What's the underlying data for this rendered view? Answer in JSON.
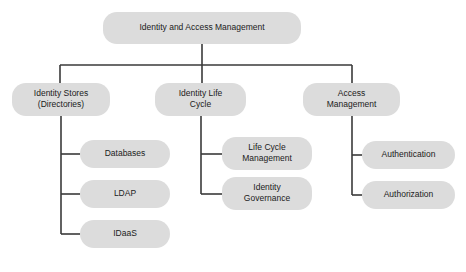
{
  "diagram": {
    "title": "Identity and Access Management",
    "type": "hierarchy-tree",
    "colors": {
      "node_fill": "#dcdcdc",
      "node_text": "#1b1b1b",
      "connector": "#3a3a3a",
      "background": "#ffffff"
    },
    "style": {
      "node_corner_radius": 14,
      "connector_width": 1.6,
      "font_size_root": 8.5,
      "font_size_level2": 8.5,
      "font_size_leaf": 8.5
    },
    "nodes": [
      {
        "id": "root",
        "label": "Identity and Access Management",
        "lines": [
          "Identity and Access Management"
        ],
        "level": 0,
        "x": 103,
        "y": 12,
        "w": 198,
        "h": 32
      },
      {
        "id": "identity-stores",
        "label": "Identity Stores (Directories)",
        "lines": [
          "Identity Stores",
          "(Directories)"
        ],
        "level": 1,
        "x": 12,
        "y": 83,
        "w": 98,
        "h": 33
      },
      {
        "id": "identity-life-cycle",
        "label": "Identity Life Cycle",
        "lines": [
          "Identity Life",
          "Cycle"
        ],
        "level": 1,
        "x": 155,
        "y": 83,
        "w": 91,
        "h": 33
      },
      {
        "id": "access-management",
        "label": "Access Management",
        "lines": [
          "Access",
          "Management"
        ],
        "level": 1,
        "x": 303,
        "y": 83,
        "w": 97,
        "h": 33
      },
      {
        "id": "databases",
        "label": "Databases",
        "lines": [
          "Databases"
        ],
        "level": 2,
        "x": 80,
        "y": 140,
        "w": 90,
        "h": 28
      },
      {
        "id": "ldap",
        "label": "LDAP",
        "lines": [
          "LDAP"
        ],
        "level": 2,
        "x": 80,
        "y": 180,
        "w": 90,
        "h": 28
      },
      {
        "id": "idaas",
        "label": "IDaaS",
        "lines": [
          "IDaaS"
        ],
        "level": 2,
        "x": 80,
        "y": 220,
        "w": 90,
        "h": 28
      },
      {
        "id": "life-cycle-management",
        "label": "Life Cycle Management",
        "lines": [
          "Life Cycle",
          "Management"
        ],
        "level": 2,
        "x": 222,
        "y": 137,
        "w": 90,
        "h": 33
      },
      {
        "id": "identity-governance",
        "label": "Identity Governance",
        "lines": [
          "Identity",
          "Governance"
        ],
        "level": 2,
        "x": 222,
        "y": 177,
        "w": 90,
        "h": 33
      },
      {
        "id": "authentication",
        "label": "Authentication",
        "lines": [
          "Authentication"
        ],
        "level": 2,
        "x": 362,
        "y": 141,
        "w": 93,
        "h": 28
      },
      {
        "id": "authorization",
        "label": "Authorization",
        "lines": [
          "Authorization"
        ],
        "level": 2,
        "x": 362,
        "y": 181,
        "w": 93,
        "h": 28
      }
    ],
    "edges": [
      {
        "id": "root-to-bus",
        "from": "root",
        "to": "bus",
        "points": [
          [
            202,
            44
          ],
          [
            202,
            65
          ]
        ]
      },
      {
        "id": "bus",
        "from": "bus-left",
        "to": "bus-right",
        "points": [
          [
            60,
            65
          ],
          [
            352,
            65
          ]
        ]
      },
      {
        "id": "bus-to-identity-stores",
        "from": "bus",
        "to": "identity-stores",
        "points": [
          [
            60,
            65
          ],
          [
            60,
            83
          ]
        ]
      },
      {
        "id": "bus-to-identity-life-cycle",
        "from": "bus",
        "to": "identity-life-cycle",
        "points": [
          [
            202,
            65
          ],
          [
            202,
            83
          ]
        ]
      },
      {
        "id": "bus-to-access-management",
        "from": "bus",
        "to": "access-management",
        "points": [
          [
            352,
            65
          ],
          [
            352,
            83
          ]
        ]
      },
      {
        "id": "identity-stores-spine",
        "from": "identity-stores",
        "to": "idaas",
        "points": [
          [
            61,
            116
          ],
          [
            61,
            234
          ]
        ]
      },
      {
        "id": "identity-stores-to-databases",
        "from": "identity-stores",
        "to": "databases",
        "points": [
          [
            61,
            154
          ],
          [
            80,
            154
          ]
        ]
      },
      {
        "id": "identity-stores-to-ldap",
        "from": "identity-stores",
        "to": "ldap",
        "points": [
          [
            61,
            194
          ],
          [
            80,
            194
          ]
        ]
      },
      {
        "id": "identity-stores-to-idaas",
        "from": "identity-stores",
        "to": "idaas",
        "points": [
          [
            61,
            234
          ],
          [
            80,
            234
          ]
        ]
      },
      {
        "id": "identity-life-cycle-spine",
        "from": "identity-life-cycle",
        "to": "identity-governance",
        "points": [
          [
            201,
            116
          ],
          [
            201,
            194
          ]
        ]
      },
      {
        "id": "identity-life-cycle-to-lcm",
        "from": "identity-life-cycle",
        "to": "life-cycle-management",
        "points": [
          [
            201,
            154
          ],
          [
            222,
            154
          ]
        ]
      },
      {
        "id": "identity-life-cycle-to-governance",
        "from": "identity-life-cycle",
        "to": "identity-governance",
        "points": [
          [
            201,
            194
          ],
          [
            222,
            194
          ]
        ]
      },
      {
        "id": "access-management-spine",
        "from": "access-management",
        "to": "authorization",
        "points": [
          [
            352,
            116
          ],
          [
            352,
            195
          ]
        ]
      },
      {
        "id": "access-management-to-authentication",
        "from": "access-management",
        "to": "authentication",
        "points": [
          [
            352,
            155
          ],
          [
            362,
            155
          ]
        ]
      },
      {
        "id": "access-management-to-authorization",
        "from": "access-management",
        "to": "authorization",
        "points": [
          [
            352,
            195
          ],
          [
            362,
            195
          ]
        ]
      }
    ]
  }
}
